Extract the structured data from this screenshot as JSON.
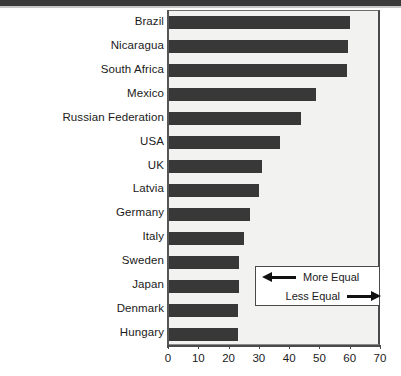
{
  "chart_data": {
    "type": "bar",
    "orientation": "horizontal",
    "title": "",
    "xlabel": "",
    "ylabel": "",
    "xlim": [
      0,
      70
    ],
    "xticks": [
      0,
      10,
      20,
      30,
      40,
      50,
      60,
      70
    ],
    "grid": false,
    "bar_color": "#383838",
    "plot_background": "#f2f2f0",
    "categories": [
      "Brazil",
      "Nicaragua",
      "South Africa",
      "Mexico",
      "Russian Federation",
      "USA",
      "UK",
      "Latvia",
      "Germany",
      "Italy",
      "Sweden",
      "Japan",
      "Denmark",
      "Hungary"
    ],
    "values": [
      60,
      59.5,
      59,
      49,
      44,
      37,
      31,
      30,
      27,
      25,
      23.5,
      23.5,
      23,
      23
    ],
    "legend": {
      "position": "inside-bottom-right",
      "entries": [
        {
          "label": "More Equal",
          "arrow": "left-arrow-icon"
        },
        {
          "label": "Less Equal",
          "arrow": "right-arrow-icon"
        }
      ]
    }
  }
}
